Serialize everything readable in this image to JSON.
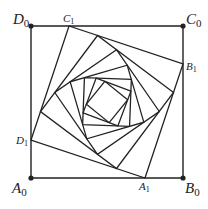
{
  "diagram": {
    "type": "nested-rotating-squares",
    "outer_square": {
      "A0": [
        31,
        178
      ],
      "B0": [
        183,
        178
      ],
      "C0": [
        183,
        26
      ],
      "D0": [
        31,
        26
      ]
    },
    "ratio": 0.25,
    "iterations": 7,
    "stroke": "#222222",
    "labels": [
      {
        "text": "D",
        "sub": "0",
        "x": 13,
        "y": 24,
        "size": 15
      },
      {
        "text": "C",
        "sub": "0",
        "x": 186,
        "y": 24,
        "size": 15
      },
      {
        "text": "A",
        "sub": "0",
        "x": 12,
        "y": 193,
        "size": 15
      },
      {
        "text": "B",
        "sub": "0",
        "x": 185,
        "y": 193,
        "size": 15
      },
      {
        "text": "C",
        "sub": "1",
        "x": 63,
        "y": 22,
        "size": 11
      },
      {
        "text": "B",
        "sub": "1",
        "x": 186,
        "y": 70,
        "size": 11
      },
      {
        "text": "D",
        "sub": "1",
        "x": 16,
        "y": 144,
        "size": 11
      },
      {
        "text": "A",
        "sub": "1",
        "x": 139,
        "y": 190,
        "size": 11
      }
    ]
  }
}
